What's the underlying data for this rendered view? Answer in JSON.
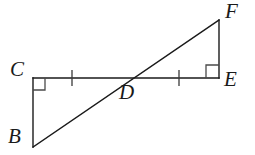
{
  "figure": {
    "width": 255,
    "height": 155,
    "background_color": "#ffffff",
    "stroke_color": "#1a1a1a",
    "mark_color": "#3a3a3a",
    "stroke_width": 1.4
  },
  "labels": {
    "C": "C",
    "B": "B",
    "D": "D",
    "E": "E",
    "F": "F"
  },
  "chart_data": {
    "type": "diagram",
    "points": [
      {
        "name": "C",
        "x": 33,
        "y": 78,
        "label": "C",
        "label_pos": "left"
      },
      {
        "name": "B",
        "x": 33,
        "y": 147,
        "label": "B",
        "label_pos": "left"
      },
      {
        "name": "D",
        "x": 126,
        "y": 78,
        "label": "D",
        "label_pos": "below-right"
      },
      {
        "name": "E",
        "x": 219,
        "y": 78,
        "label": "E",
        "label_pos": "right"
      },
      {
        "name": "F",
        "x": 219,
        "y": 20,
        "label": "F",
        "label_pos": "right"
      }
    ],
    "segments": [
      {
        "name": "CE",
        "from": "C",
        "to": "E",
        "x1": 33,
        "y1": 78,
        "x2": 219,
        "y2": 78
      },
      {
        "name": "CB",
        "from": "C",
        "to": "B",
        "x1": 33,
        "y1": 78,
        "x2": 33,
        "y2": 147
      },
      {
        "name": "FE",
        "from": "F",
        "to": "E",
        "x1": 219,
        "y1": 20,
        "x2": 219,
        "y2": 78
      },
      {
        "name": "BF",
        "from": "B",
        "to": "F",
        "x1": 33,
        "y1": 147,
        "x2": 219,
        "y2": 20
      }
    ],
    "right_angles": [
      {
        "name": "right-angle-C",
        "at": "C",
        "x": 33,
        "y": 78,
        "size": 12,
        "dir_x": 1,
        "dir_y": 1
      },
      {
        "name": "right-angle-E",
        "at": "E",
        "x": 219,
        "y": 78,
        "size": 13,
        "dir_x": -1,
        "dir_y": -1
      }
    ],
    "tick_marks": [
      {
        "name": "tick-CD",
        "on": "CD",
        "x": 72,
        "y": 78,
        "half_len": 8
      },
      {
        "name": "tick-DE",
        "on": "DE",
        "x": 179,
        "y": 78,
        "half_len": 8
      }
    ],
    "triangles": [
      {
        "name": "BCD",
        "vertices": [
          "B",
          "C",
          "D"
        ],
        "right_angle_at": "C"
      },
      {
        "name": "FED",
        "vertices": [
          "F",
          "E",
          "D"
        ],
        "right_angle_at": "E"
      }
    ],
    "annotations": [
      "CD and DE marked congruent with single tick marks",
      "BF is a straight line intersecting CE at D"
    ]
  }
}
